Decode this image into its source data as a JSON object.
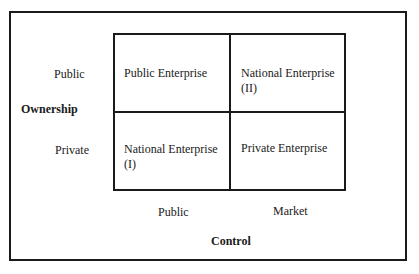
{
  "diagram": {
    "row_axis": {
      "title": "Ownership",
      "rows": [
        "Public",
        "Private"
      ]
    },
    "column_axis": {
      "title": "Control",
      "columns": [
        "Public",
        "Market"
      ]
    },
    "cells": [
      {
        "row": "Public",
        "column": "Public",
        "line1": "Public Enterprise",
        "line2": ""
      },
      {
        "row": "Public",
        "column": "Market",
        "line1": "National Enterprise",
        "line2": "(II)"
      },
      {
        "row": "Private",
        "column": "Public",
        "line1": "National Enterprise",
        "line2": "(I)"
      },
      {
        "row": "Private",
        "column": "Market",
        "line1": "Private Enterprise",
        "line2": ""
      }
    ],
    "colors": {
      "line": "#1a1a1a",
      "background": "#ffffff"
    }
  }
}
